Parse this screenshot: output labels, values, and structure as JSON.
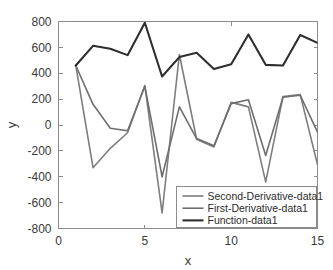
{
  "chart_data": {
    "type": "line",
    "title": "",
    "xlabel": "x",
    "ylabel": "y",
    "xlim": [
      0,
      15
    ],
    "ylim": [
      -800,
      800
    ],
    "xticks": [
      0,
      5,
      10,
      15
    ],
    "yticks": [
      -800,
      -600,
      -400,
      -200,
      0,
      200,
      400,
      600,
      800
    ],
    "xticklabels": [
      "0",
      "5",
      "10",
      "15"
    ],
    "yticklabels": [
      "-800",
      "-600",
      "-400",
      "-200",
      "0",
      "200",
      "400",
      "600",
      "800"
    ],
    "grid": false,
    "legend_position": "lower right",
    "x": [
      1,
      2,
      3,
      4,
      5,
      6,
      7,
      8,
      9,
      10,
      11,
      12,
      13,
      14,
      15
    ],
    "series": [
      {
        "name": "Second-Derivative-data1",
        "color": "#7d7d7d",
        "width": 1.6,
        "values": [
          460,
          -330,
          -180,
          -60,
          305,
          -680,
          545,
          -110,
          -170,
          175,
          140,
          -440,
          220,
          235,
          -305
        ]
      },
      {
        "name": "First-Derivative-data1",
        "color": "#6e6e6e",
        "width": 1.6,
        "values": [
          460,
          160,
          -25,
          -45,
          300,
          -400,
          140,
          -105,
          -160,
          165,
          195,
          -235,
          215,
          230,
          -55
        ]
      },
      {
        "name": "Function-data1",
        "color": "#2e2e2e",
        "width": 2.1,
        "values": [
          460,
          612,
          590,
          540,
          790,
          375,
          525,
          558,
          432,
          470,
          700,
          465,
          460,
          695,
          635
        ]
      }
    ]
  },
  "legend": {
    "entries": [
      {
        "label": "Second-Derivative-data1"
      },
      {
        "label": "First-Derivative-data1"
      },
      {
        "label": "Function-data1"
      }
    ]
  },
  "axes": {
    "x_title": "x",
    "y_title": "y"
  }
}
